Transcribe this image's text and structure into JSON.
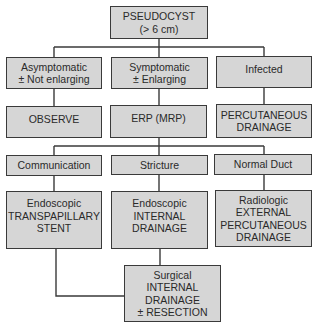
{
  "diagram": {
    "type": "flowchart",
    "nodes": {
      "root": {
        "lines": [
          "PSEUDOCYST",
          "(> 6 cm)"
        ]
      },
      "asymptomatic": {
        "lines": [
          "Asymptomatic",
          "± Not enlarging"
        ]
      },
      "symptomatic": {
        "lines": [
          "Symptomatic",
          "± Enlarging"
        ]
      },
      "infected": {
        "lines": [
          "Infected"
        ]
      },
      "observe": {
        "lines": [
          "OBSERVE"
        ]
      },
      "erp": {
        "lines": [
          "ERP (MRP)"
        ]
      },
      "percutaneous": {
        "lines": [
          "PERCUTANEOUS",
          "DRAINAGE"
        ]
      },
      "communication": {
        "lines": [
          "Communication"
        ]
      },
      "stricture": {
        "lines": [
          "Stricture"
        ]
      },
      "normal_duct": {
        "lines": [
          "Normal Duct"
        ]
      },
      "transpapillary": {
        "lines": [
          "Endoscopic",
          "TRANSPAPILLARY",
          "STENT"
        ]
      },
      "internal_drainage": {
        "lines": [
          "Endoscopic",
          "INTERNAL",
          "DRAINAGE"
        ]
      },
      "radiologic": {
        "lines": [
          "Radiologic",
          "EXTERNAL",
          "PERCUTANEOUS",
          "DRAINAGE"
        ]
      },
      "surgical": {
        "lines": [
          "Surgical",
          "INTERNAL",
          "DRAINAGE",
          "± RESECTION"
        ]
      }
    },
    "edges": [
      [
        "root",
        "asymptomatic"
      ],
      [
        "root",
        "symptomatic"
      ],
      [
        "root",
        "infected"
      ],
      [
        "asymptomatic",
        "observe"
      ],
      [
        "symptomatic",
        "erp"
      ],
      [
        "infected",
        "percutaneous"
      ],
      [
        "erp",
        "communication"
      ],
      [
        "erp",
        "stricture"
      ],
      [
        "erp",
        "normal_duct"
      ],
      [
        "communication",
        "transpapillary"
      ],
      [
        "stricture",
        "internal_drainage"
      ],
      [
        "normal_duct",
        "radiologic"
      ],
      [
        "transpapillary",
        "surgical"
      ],
      [
        "internal_drainage",
        "surgical"
      ]
    ],
    "colors": {
      "box_fill": "#d6d6d6",
      "border": "#3a3a3a",
      "background": "#ffffff"
    }
  }
}
